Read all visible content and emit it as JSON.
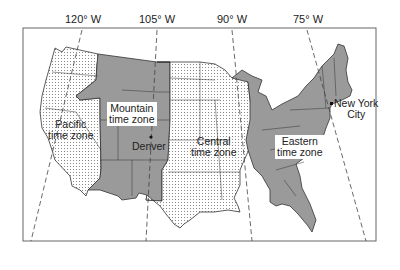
{
  "map": {
    "title": "United States time zones",
    "longitude_labels": [
      {
        "label": "120° W",
        "x": 83
      },
      {
        "label": "105° W",
        "x": 157
      },
      {
        "label": "90° W",
        "x": 232
      },
      {
        "label": "75° W",
        "x": 308
      }
    ],
    "zones": [
      {
        "id": "pacific",
        "label_line1": "Pacific",
        "label_line2": "time zone",
        "pattern": "dotted"
      },
      {
        "id": "mountain",
        "label_line1": "Mountain",
        "label_line2": "time zone",
        "pattern": "solid-gray"
      },
      {
        "id": "central",
        "label_line1": "Central",
        "label_line2": "time zone",
        "pattern": "dotted"
      },
      {
        "id": "eastern",
        "label_line1": "Eastern",
        "label_line2": "time zone",
        "pattern": "solid-gray"
      }
    ],
    "cities": [
      {
        "name_line1": "Denver",
        "name_line2": ""
      },
      {
        "name_line1": "New York",
        "name_line2": "City"
      }
    ],
    "colors": {
      "solid_zone": "#9a9a9a",
      "dotted_zone_bg": "#ffffff",
      "dot": "#8a8a8a",
      "border": "#333333",
      "frame": "#555555"
    }
  }
}
